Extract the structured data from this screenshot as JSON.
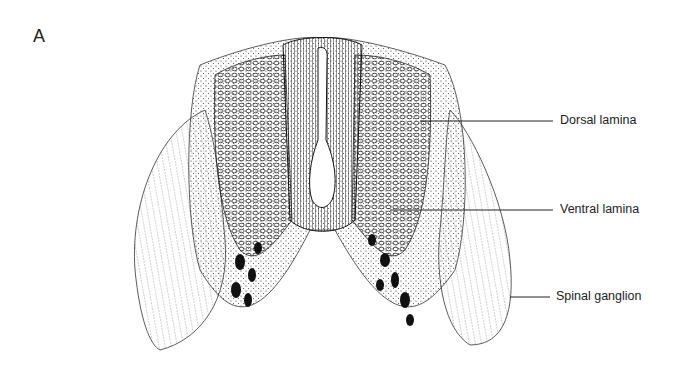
{
  "figure": {
    "panel_label": "A",
    "labels": [
      {
        "text": "Dorsal lamina"
      },
      {
        "text": "Ventral lamina"
      },
      {
        "text": "Spinal ganglion"
      }
    ]
  }
}
